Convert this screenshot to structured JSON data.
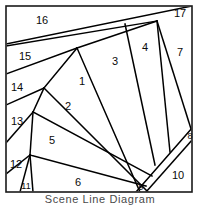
{
  "figure": {
    "caption": "Scene Line Diagram",
    "background_color": "#ffffff",
    "border_color": "#1a1a1a",
    "line_color": "#000000",
    "label_color": "#0a0a0a",
    "frame": {
      "x": 6,
      "y": 6,
      "width": 186,
      "height": 186
    }
  },
  "diagram": {
    "type": "scene-line-wedge-partition",
    "region_count": 17,
    "regions": [
      {
        "id": "1",
        "label": "1",
        "x": 82,
        "y": 82
      },
      {
        "id": "2",
        "label": "2",
        "x": 68,
        "y": 107
      },
      {
        "id": "3",
        "label": "3",
        "x": 115,
        "y": 62
      },
      {
        "id": "4",
        "label": "4",
        "x": 145,
        "y": 48
      },
      {
        "id": "5",
        "label": "5",
        "x": 52,
        "y": 141
      },
      {
        "id": "6",
        "label": "6",
        "x": 78,
        "y": 183
      },
      {
        "id": "7",
        "label": "7",
        "x": 180,
        "y": 53
      },
      {
        "id": "8",
        "label": "8",
        "x": 190,
        "y": 137
      },
      {
        "id": "9",
        "label": "9",
        "x": 141,
        "y": 188
      },
      {
        "id": "10",
        "label": "10",
        "x": 178,
        "y": 176
      },
      {
        "id": "11",
        "label": "11",
        "x": 26,
        "y": 187
      },
      {
        "id": "12",
        "label": "12",
        "x": 16,
        "y": 165
      },
      {
        "id": "13",
        "label": "13",
        "x": 17,
        "y": 122
      },
      {
        "id": "14",
        "label": "14",
        "x": 17,
        "y": 88
      },
      {
        "id": "15",
        "label": "15",
        "x": 25,
        "y": 57
      },
      {
        "id": "16",
        "label": "16",
        "x": 42,
        "y": 21
      },
      {
        "id": "17",
        "label": "17",
        "x": 180,
        "y": 14
      }
    ],
    "edges": [
      {
        "name": "top-long-diagonal",
        "x1": 6,
        "y1": 44,
        "x2": 192,
        "y2": 6
      },
      {
        "name": "band-16-lower",
        "x1": 6,
        "y1": 46,
        "x2": 157,
        "y2": 21
      },
      {
        "name": "band-15-lower",
        "x1": 6,
        "y1": 74,
        "x2": 77,
        "y2": 48
      },
      {
        "name": "fan-edge-a",
        "x1": 77,
        "y1": 48,
        "x2": 157,
        "y2": 21
      },
      {
        "name": "fan-edge-1-3",
        "x1": 77,
        "y1": 48,
        "x2": 140,
        "y2": 192
      },
      {
        "name": "fan-edge-3-4",
        "x1": 125,
        "y1": 24,
        "x2": 155,
        "y2": 165
      },
      {
        "name": "fan-edge-4-7",
        "x1": 157,
        "y1": 21,
        "x2": 170,
        "y2": 152
      },
      {
        "name": "fan-edge-7-right",
        "x1": 157,
        "y1": 21,
        "x2": 192,
        "y2": 132
      },
      {
        "name": "band-14-lower",
        "x1": 6,
        "y1": 105,
        "x2": 44,
        "y2": 88
      },
      {
        "name": "vertex-14-to-apex",
        "x1": 44,
        "y1": 88,
        "x2": 77,
        "y2": 48
      },
      {
        "name": "edge-1-2",
        "x1": 44,
        "y1": 88,
        "x2": 148,
        "y2": 192
      },
      {
        "name": "band-13-lower",
        "x1": 6,
        "y1": 143,
        "x2": 33,
        "y2": 112
      },
      {
        "name": "vertex-13-to-14",
        "x1": 33,
        "y1": 112,
        "x2": 44,
        "y2": 88
      },
      {
        "name": "edge-2-5",
        "x1": 33,
        "y1": 112,
        "x2": 152,
        "y2": 176
      },
      {
        "name": "band-12-lower",
        "x1": 6,
        "y1": 174,
        "x2": 30,
        "y2": 155
      },
      {
        "name": "vertex-12-to-13",
        "x1": 30,
        "y1": 155,
        "x2": 33,
        "y2": 112
      },
      {
        "name": "edge-5-6",
        "x1": 30,
        "y1": 155,
        "x2": 146,
        "y2": 186
      },
      {
        "name": "sliver-11-left",
        "x1": 30,
        "y1": 155,
        "x2": 20,
        "y2": 192
      },
      {
        "name": "sliver-11-right",
        "x1": 30,
        "y1": 155,
        "x2": 33,
        "y2": 192
      },
      {
        "name": "slab-8-9-upper",
        "x1": 192,
        "y1": 128,
        "x2": 136,
        "y2": 192
      },
      {
        "name": "slab-8-9-lower",
        "x1": 192,
        "y1": 140,
        "x2": 146,
        "y2": 192
      }
    ]
  }
}
